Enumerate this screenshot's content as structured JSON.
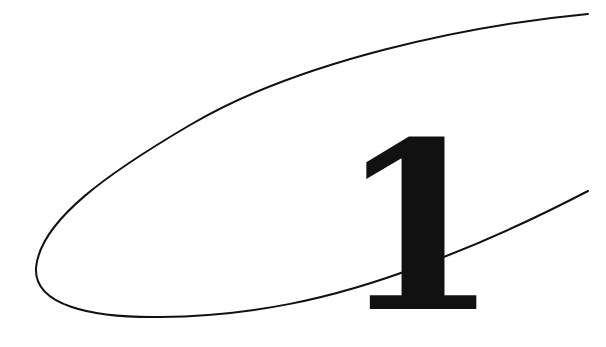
{
  "chapter": {
    "number": "1"
  },
  "colors": {
    "background": "#ffffff",
    "ink": "#111111"
  }
}
